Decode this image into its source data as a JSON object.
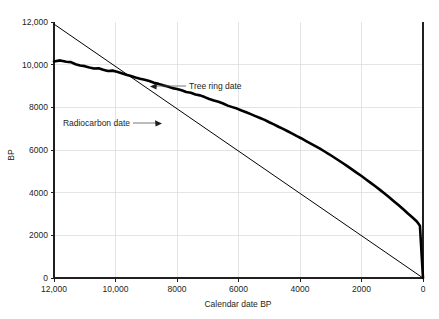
{
  "chart_data": {
    "type": "line",
    "title": "",
    "xlabel": "Calendar date BP",
    "ylabel": "BP",
    "xlim": [
      12000,
      0
    ],
    "ylim": [
      0,
      12000
    ],
    "x_reversed": true,
    "grid": true,
    "legend": "none",
    "xticks": [
      12000,
      10000,
      8000,
      6000,
      4000,
      2000,
      0
    ],
    "xtick_labels": [
      "12,000",
      "10,000",
      "8000",
      "6000",
      "4000",
      "2000",
      "0"
    ],
    "yticks": [
      0,
      2000,
      4000,
      6000,
      8000,
      10000,
      12000
    ],
    "ytick_labels": [
      "0",
      "2000",
      "4000",
      "6000",
      "8000",
      "10,000",
      "12,000"
    ],
    "annotations": [
      {
        "name": "tree-ring-date",
        "text": "Tree ring date",
        "x": 9250,
        "y": 8900
      },
      {
        "name": "radiocarbon-date",
        "text": "Radiocarbon date",
        "x": 11450,
        "y": 7300
      }
    ],
    "series": [
      {
        "name": "Tree ring date",
        "style": "thin-straight-line",
        "color": "#000000",
        "x": [
          12000,
          0
        ],
        "values": [
          11900,
          0
        ]
      },
      {
        "name": "Radiocarbon date",
        "style": "thick-wiggly-line",
        "color": "#000000",
        "x": [
          12000,
          11800,
          11600,
          11450,
          11300,
          11150,
          11000,
          10850,
          10700,
          10550,
          10400,
          10250,
          10100,
          9950,
          9800,
          9650,
          9500,
          9350,
          9200,
          9050,
          8900,
          8750,
          8600,
          8450,
          8300,
          8150,
          8000,
          7850,
          7700,
          7550,
          7400,
          7250,
          7100,
          6950,
          6800,
          6650,
          6500,
          6350,
          6200,
          6050,
          5900,
          5750,
          5600,
          5450,
          5300,
          5150,
          5000,
          4850,
          4700,
          4550,
          4400,
          4250,
          4100,
          3950,
          3800,
          3650,
          3500,
          3350,
          3200,
          3050,
          2900,
          2750,
          2600,
          2450,
          2300,
          2150,
          2000,
          1850,
          1700,
          1550,
          1400,
          1250,
          1100,
          950,
          800,
          650,
          500,
          350,
          200,
          100,
          0
        ],
        "values": [
          10150,
          10200,
          10140,
          10120,
          10020,
          9960,
          9930,
          9870,
          9820,
          9830,
          9760,
          9700,
          9720,
          9670,
          9600,
          9530,
          9470,
          9400,
          9340,
          9290,
          9230,
          9150,
          9100,
          9030,
          8980,
          8900,
          8860,
          8800,
          8720,
          8680,
          8600,
          8560,
          8480,
          8390,
          8320,
          8260,
          8180,
          8080,
          8010,
          7940,
          7850,
          7770,
          7680,
          7590,
          7500,
          7410,
          7300,
          7200,
          7090,
          6990,
          6880,
          6770,
          6650,
          6540,
          6420,
          6300,
          6180,
          6060,
          5930,
          5800,
          5660,
          5520,
          5380,
          5230,
          5080,
          4930,
          4780,
          4620,
          4460,
          4300,
          4130,
          3960,
          3780,
          3600,
          3420,
          3230,
          3040,
          2850,
          2650,
          2450,
          0
        ]
      }
    ]
  },
  "plot": {
    "left_px": 54,
    "top_px": 22,
    "right_px": 423,
    "bottom_px": 278
  }
}
